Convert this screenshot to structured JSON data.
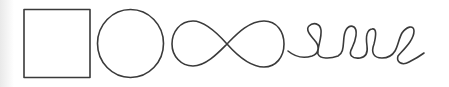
{
  "diagram": {
    "stroke_color": "#3a3a3a",
    "background_color": "#ffffff",
    "shapes": [
      {
        "name": "square",
        "label": "Square"
      },
      {
        "name": "circle",
        "label": "Circle"
      },
      {
        "name": "infinity",
        "label": "Infinity loop"
      },
      {
        "name": "spiral-loops",
        "label": "Looped line"
      }
    ]
  }
}
